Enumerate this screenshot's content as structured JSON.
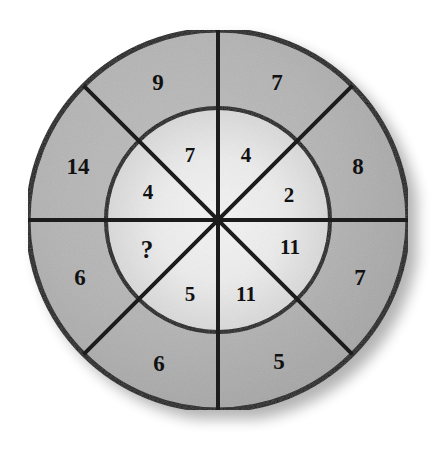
{
  "figure": {
    "kind": "circular-number-puzzle",
    "unknown_marker": "?",
    "background_color": "#ffffff",
    "outer_ring_color": "#b2b2b2",
    "inner_disc_color": "#e8e8e8",
    "stroke_color": "#1a1a1a",
    "text_color": "#111111"
  },
  "geometry": {
    "center_x": 218,
    "center_y": 220,
    "outer_radius": 190,
    "inner_radius": 112,
    "spoke_count": 8,
    "spoke_angles_deg": [
      0,
      45,
      90,
      135,
      180,
      225,
      270,
      315
    ],
    "outer_label_radius": 151,
    "inner_label_radius": 64
  },
  "outer_ring": {
    "name": "outer-ring",
    "segments": [
      {
        "id": "outer-nnw",
        "label": "9",
        "angle_deg": 112.5,
        "x": 158,
        "y": 82
      },
      {
        "id": "outer-nne",
        "label": "7",
        "angle_deg": 67.5,
        "x": 277,
        "y": 82
      },
      {
        "id": "outer-ene",
        "label": "8",
        "angle_deg": 22.5,
        "x": 358,
        "y": 166
      },
      {
        "id": "outer-ese",
        "label": "7",
        "angle_deg": 337.5,
        "x": 360,
        "y": 277
      },
      {
        "id": "outer-sse",
        "label": "5",
        "angle_deg": 292.5,
        "x": 279,
        "y": 361
      },
      {
        "id": "outer-ssw",
        "label": "6",
        "angle_deg": 247.5,
        "x": 159,
        "y": 363
      },
      {
        "id": "outer-wsw",
        "label": "6",
        "angle_deg": 202.5,
        "x": 80,
        "y": 277
      },
      {
        "id": "outer-wnw",
        "label": "14",
        "angle_deg": 157.5,
        "x": 78,
        "y": 166
      }
    ]
  },
  "inner_ring": {
    "name": "inner-ring",
    "segments": [
      {
        "id": "inner-nnw",
        "label": "7",
        "angle_deg": 112.5,
        "x": 190,
        "y": 155
      },
      {
        "id": "inner-nne",
        "label": "4",
        "angle_deg": 67.5,
        "x": 246,
        "y": 155
      },
      {
        "id": "inner-ene",
        "label": "2",
        "angle_deg": 22.5,
        "x": 289,
        "y": 195
      },
      {
        "id": "inner-ese",
        "label": "11",
        "angle_deg": 337.5,
        "x": 290,
        "y": 247
      },
      {
        "id": "inner-sse",
        "label": "11",
        "angle_deg": 292.5,
        "x": 246,
        "y": 294
      },
      {
        "id": "inner-ssw",
        "label": "5",
        "angle_deg": 247.5,
        "x": 190,
        "y": 294
      },
      {
        "id": "inner-wsw",
        "label": "?",
        "angle_deg": 202.5,
        "x": 147,
        "y": 249
      },
      {
        "id": "inner-wnw",
        "label": "4",
        "angle_deg": 157.5,
        "x": 148,
        "y": 192
      }
    ]
  }
}
